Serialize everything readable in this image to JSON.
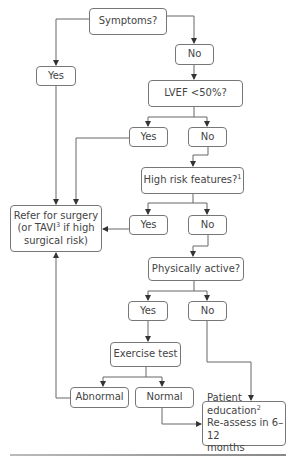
{
  "flowchart": {
    "nodes": {
      "symptoms": {
        "label": "Symptoms?"
      },
      "symptoms_yes": {
        "label": "Yes"
      },
      "symptoms_no": {
        "label": "No"
      },
      "lvef": {
        "label": "LVEF <50%?"
      },
      "lvef_yes": {
        "label": "Yes"
      },
      "lvef_no": {
        "label": "No"
      },
      "high_risk": {
        "label": "High risk features?",
        "sup": "1"
      },
      "high_risk_yes": {
        "label": "Yes"
      },
      "high_risk_no": {
        "label": "No"
      },
      "refer": {
        "line1": "Refer for surgery",
        "line2a": "(or TAVI",
        "line2sup": "3",
        "line2b": " if high",
        "line3": "surgical risk)"
      },
      "active": {
        "label": "Physically active?"
      },
      "active_yes": {
        "label": "Yes"
      },
      "active_no": {
        "label": "No"
      },
      "exercise": {
        "label": "Exercise test"
      },
      "abnormal": {
        "label": "Abnormal"
      },
      "normal": {
        "label": "Normal"
      },
      "patient": {
        "line1": "Patient education",
        "line1sup": "2",
        "line2": "Re-assess in 6–12",
        "line3": "months"
      }
    },
    "colors": {
      "line": "#555555",
      "border": "#777777",
      "text": "#444444"
    }
  }
}
